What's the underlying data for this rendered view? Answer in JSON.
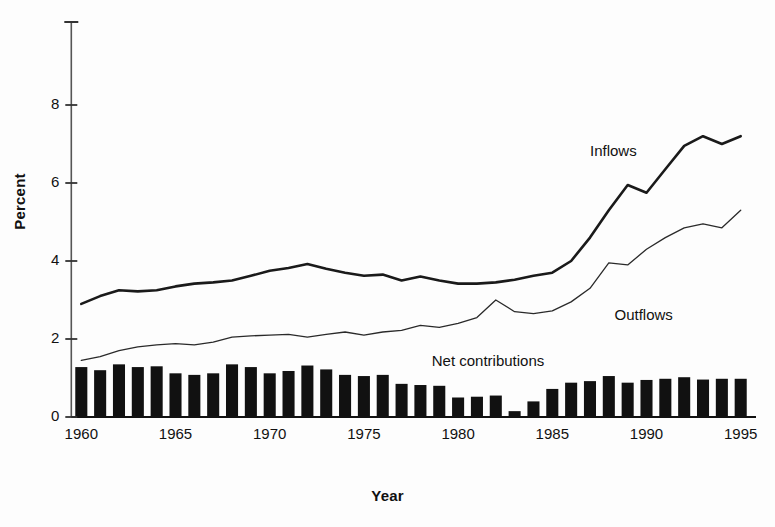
{
  "chart_data": {
    "type": "bar",
    "title": "",
    "xlabel": "Year",
    "ylabel": "Percent",
    "xlim": [
      1959.4,
      1995.6
    ],
    "ylim": [
      0,
      10
    ],
    "grid": false,
    "legend_position": "inline-annotations",
    "x": [
      1960,
      1961,
      1962,
      1963,
      1964,
      1965,
      1966,
      1967,
      1968,
      1969,
      1970,
      1971,
      1972,
      1973,
      1974,
      1975,
      1976,
      1977,
      1978,
      1979,
      1980,
      1981,
      1982,
      1983,
      1984,
      1985,
      1986,
      1987,
      1988,
      1989,
      1990,
      1991,
      1992,
      1993,
      1994,
      1995
    ],
    "xticks": [
      1960,
      1965,
      1970,
      1975,
      1980,
      1985,
      1990,
      1995
    ],
    "xticklabels": [
      "1960",
      "1965",
      "1970",
      "1975",
      "1980",
      "1985",
      "1990",
      "1995"
    ],
    "yticks": [
      0,
      2,
      4,
      6,
      8
    ],
    "yticklabels": [
      "0",
      "2",
      "4",
      "6",
      "8"
    ],
    "series": [
      {
        "name": "Inflows",
        "type": "line",
        "style": "thick-solid",
        "color": "#1a1a1a",
        "values": [
          2.9,
          3.1,
          3.25,
          3.22,
          3.25,
          3.35,
          3.42,
          3.45,
          3.5,
          3.62,
          3.75,
          3.82,
          3.92,
          3.8,
          3.7,
          3.62,
          3.65,
          3.5,
          3.6,
          3.5,
          3.42,
          3.42,
          3.45,
          3.52,
          3.62,
          3.7,
          4.0,
          4.6,
          5.3,
          5.95,
          5.75,
          6.35,
          6.95,
          7.2,
          7.0,
          7.2
        ]
      },
      {
        "name": "Outflows",
        "type": "line",
        "style": "thin-solid",
        "color": "#2a2a2a",
        "values": [
          1.45,
          1.55,
          1.7,
          1.8,
          1.85,
          1.88,
          1.85,
          1.92,
          2.05,
          2.08,
          2.1,
          2.12,
          2.05,
          2.12,
          2.18,
          2.1,
          2.18,
          2.22,
          2.35,
          2.3,
          2.4,
          2.55,
          3.0,
          2.7,
          2.65,
          2.72,
          2.95,
          3.3,
          3.95,
          3.9,
          4.3,
          4.6,
          4.85,
          4.95,
          4.85,
          5.3
        ]
      },
      {
        "name": "Net contributions",
        "type": "bar",
        "color": "#111111",
        "values": [
          1.28,
          1.2,
          1.35,
          1.28,
          1.3,
          1.12,
          1.08,
          1.12,
          1.35,
          1.28,
          1.12,
          1.18,
          1.32,
          1.22,
          1.08,
          1.05,
          1.08,
          0.85,
          0.82,
          0.8,
          0.5,
          0.52,
          0.55,
          0.15,
          0.4,
          0.72,
          0.88,
          0.92,
          1.05,
          0.88,
          0.95,
          0.98,
          1.02,
          0.96,
          0.98,
          0.98
        ]
      }
    ],
    "annotations": [
      {
        "name": "inflows-label",
        "text": "Inflows",
        "x": 1987.0,
        "y": 6.8
      },
      {
        "name": "outflows-label",
        "text": "Outflows",
        "x": 1988.3,
        "y": 2.6
      },
      {
        "name": "net-contributions-label",
        "text": "Net contributions",
        "x": 1978.6,
        "y": 1.4
      }
    ]
  }
}
